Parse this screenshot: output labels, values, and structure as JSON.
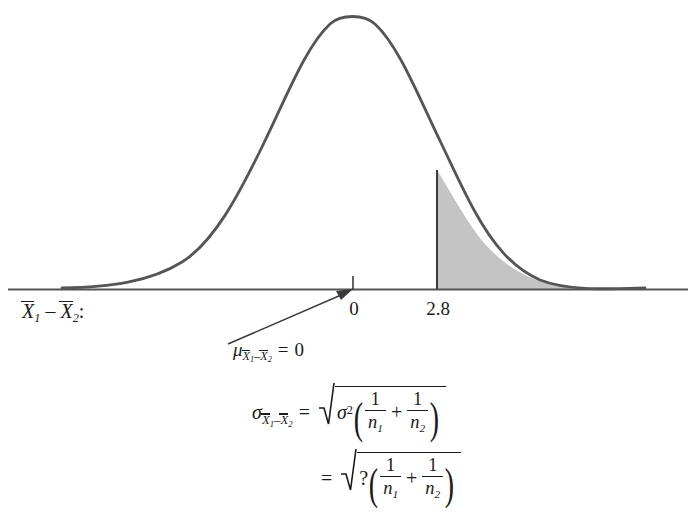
{
  "diagram": {
    "type": "normal-distribution-curve-with-shaded-tail",
    "axis_caption": {
      "x1_bar": "X",
      "x1_sub": "1",
      "minus": "–",
      "x2_bar": "X",
      "x2_sub": "2",
      "colon": ":"
    },
    "ticks": [
      {
        "name": "mean-tick",
        "label": "0",
        "x_value": 0
      },
      {
        "name": "critical-tick",
        "label": "2.8",
        "x_value": 2.8
      }
    ],
    "shaded_region": {
      "name": "upper-tail-shaded-area",
      "starts_at_label": "2.8",
      "fill_color": "#c4c4c4",
      "stroke_color": "#555555"
    },
    "curve": {
      "stroke_color": "#555555",
      "baseline_color": "#555555",
      "peak_label": "0"
    },
    "mu_annotation": {
      "symbol": "μ",
      "sub_x1": "X",
      "sub_x1_idx": "1",
      "sub_minus": "–",
      "sub_x2": "X",
      "sub_x2_idx": "2",
      "equals": "=",
      "value": "0"
    },
    "sigma_formula_line1": {
      "symbol": "σ",
      "sub_x1": "X",
      "sub_x1_idx": "1",
      "sub_minus": "–",
      "sub_x2": "X",
      "sub_x2_idx": "2",
      "equals": "=",
      "radicand_leading": "σ",
      "radicand_leading_exp": "2",
      "paren_open": "(",
      "frac1_num": "1",
      "frac1_den": "n",
      "frac1_den_idx": "1",
      "plus": "+",
      "frac2_num": "1",
      "frac2_den": "n",
      "frac2_den_idx": "2",
      "paren_close": ")"
    },
    "sigma_formula_line2": {
      "equals": "=",
      "radicand_leading": "?",
      "paren_open": "(",
      "frac1_num": "1",
      "frac1_den": "n",
      "frac1_den_idx": "1",
      "plus": "+",
      "frac2_num": "1",
      "frac2_den": "n",
      "frac2_den_idx": "2",
      "paren_close": ")"
    }
  }
}
